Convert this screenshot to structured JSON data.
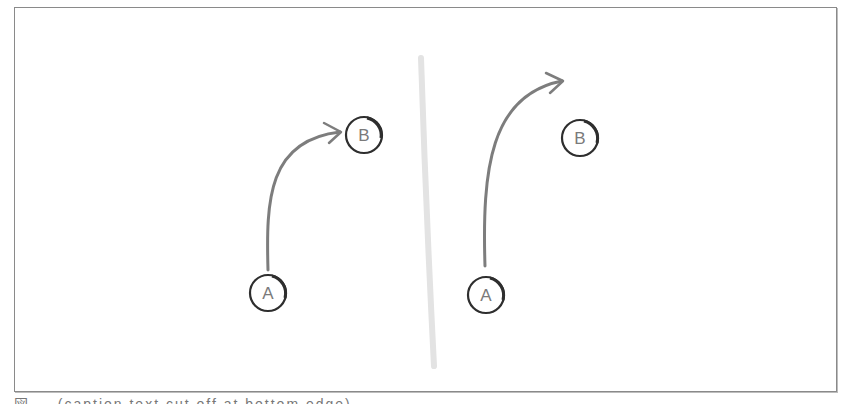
{
  "figure": {
    "panels": [
      {
        "id": "left",
        "nodes": [
          {
            "label": "A",
            "cx": 268,
            "cy": 293
          },
          {
            "label": "B",
            "cx": 364,
            "cy": 135
          }
        ],
        "arrow": {
          "from": "A",
          "to": "B",
          "reaches_target": true
        }
      },
      {
        "id": "right",
        "nodes": [
          {
            "label": "A",
            "cx": 486,
            "cy": 295
          },
          {
            "label": "B",
            "cx": 580,
            "cy": 138
          }
        ],
        "arrow": {
          "from": "A",
          "to": "overshoot",
          "reaches_target": false
        }
      }
    ],
    "divider": "vertical-gray-stroke",
    "colors": {
      "frame": "#8a8a8a",
      "arrow": "#7d7d7d",
      "node_stroke": "#333333",
      "label": "#7a7a7a",
      "divider": "#e2e2e2"
    }
  },
  "labels": {
    "left_a": "A",
    "left_b": "B",
    "right_a": "A",
    "right_b": "B"
  },
  "caption": "図 — (caption text cut off at bottom edge)"
}
